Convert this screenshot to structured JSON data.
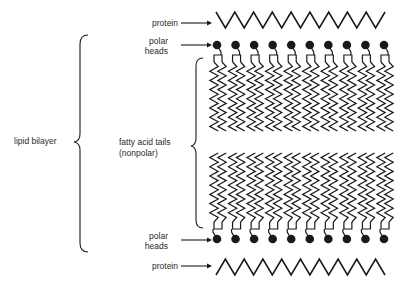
{
  "diagram": {
    "labels": {
      "protein_top": "protein",
      "polar_heads_top_line1": "polar",
      "polar_heads_top_line2": "heads",
      "fatty_acid_line1": "fatty acid tails",
      "fatty_acid_line2": "(nonpolar)",
      "lipid_bilayer": "lipid bilayer",
      "polar_heads_bottom_line1": "polar",
      "polar_heads_bottom_line2": "heads",
      "protein_bottom": "protein"
    },
    "components": {
      "lipid_count_per_leaflet": 10,
      "tails_per_lipid": 2,
      "protein_zigzag_peaks": 9
    },
    "colors": {
      "ink": "#1a1a1a",
      "background": "#ffffff"
    }
  }
}
